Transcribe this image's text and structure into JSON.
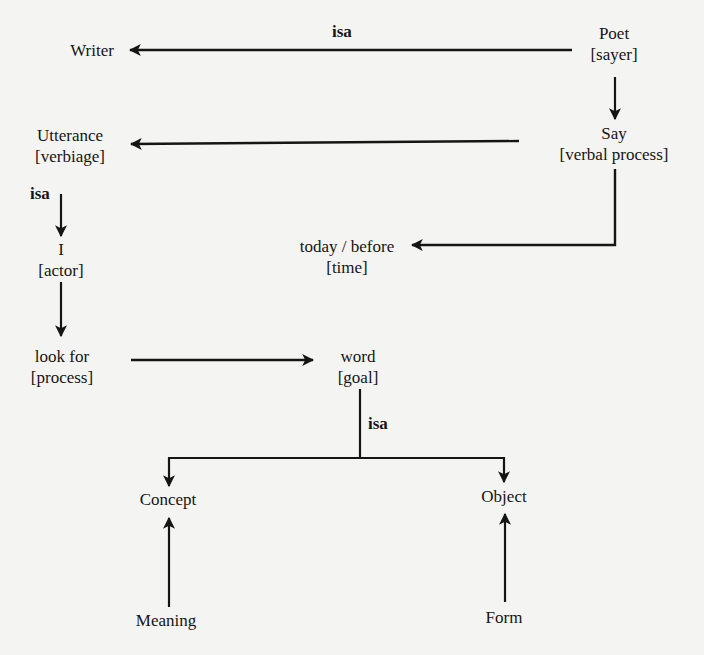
{
  "diagram": {
    "type": "semantic-network",
    "nodes": {
      "writer": {
        "text": "Writer",
        "role": ""
      },
      "poet": {
        "text": "Poet",
        "role": "[sayer]"
      },
      "say": {
        "text": "Say",
        "role": "[verbal process]"
      },
      "utterance": {
        "text": "Utterance",
        "role": "[verbiage]"
      },
      "i": {
        "text": "I",
        "role": "[actor]"
      },
      "today": {
        "text": "today / before",
        "role": "[time]"
      },
      "lookfor": {
        "text": "look for",
        "role": "[process]"
      },
      "word": {
        "text": "word",
        "role": "[goal]"
      },
      "concept": {
        "text": "Concept",
        "role": ""
      },
      "object": {
        "text": "Object",
        "role": ""
      },
      "meaning": {
        "text": "Meaning",
        "role": ""
      },
      "form": {
        "text": "Form",
        "role": ""
      }
    },
    "edge_labels": {
      "poet_writer": "isa",
      "utterance_i": "isa",
      "word_split": "isa"
    },
    "edges": [
      {
        "from": "Poet",
        "to": "Writer",
        "label": "isa"
      },
      {
        "from": "Poet",
        "to": "Say",
        "label": ""
      },
      {
        "from": "Say",
        "to": "Utterance",
        "label": ""
      },
      {
        "from": "Say",
        "to": "today / before",
        "label": ""
      },
      {
        "from": "Utterance",
        "to": "I",
        "label": "isa"
      },
      {
        "from": "I",
        "to": "look for",
        "label": ""
      },
      {
        "from": "look for",
        "to": "word",
        "label": ""
      },
      {
        "from": "word",
        "to": "Concept",
        "label": "isa"
      },
      {
        "from": "word",
        "to": "Object",
        "label": "isa"
      },
      {
        "from": "Meaning",
        "to": "Concept",
        "label": ""
      },
      {
        "from": "Form",
        "to": "Object",
        "label": ""
      }
    ],
    "colors": {
      "background": "#f4f4f2",
      "ink": "#151515"
    }
  }
}
